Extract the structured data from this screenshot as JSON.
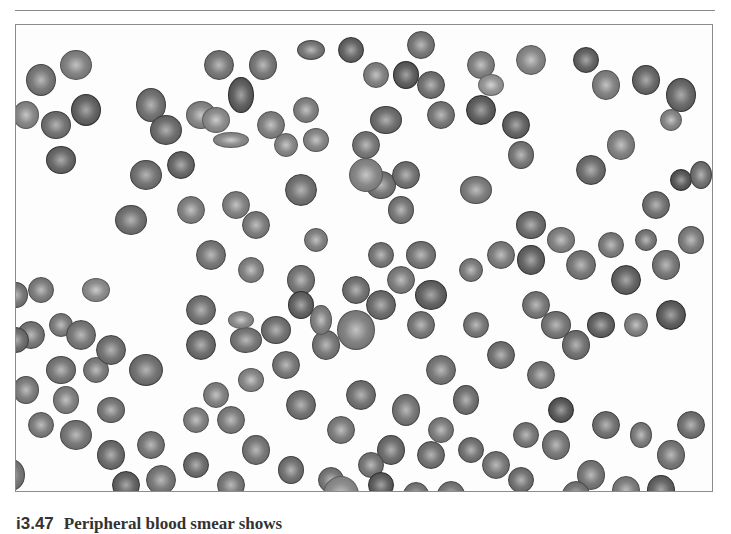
{
  "page": {
    "header_text": "",
    "caption_number": "i3.47",
    "caption_text": "Peripheral blood smear shows"
  },
  "figure": {
    "colors": {
      "background": "#fdfdfd",
      "frame": "#8c8c8c",
      "cell_dark": "#4a4a4a",
      "cell_mid": "#7a7a7a",
      "cell_light": "#bdbdbd"
    },
    "cells": [
      [
        40,
        55,
        30,
        32,
        0.55
      ],
      [
        75,
        40,
        32,
        30,
        0.45
      ],
      [
        85,
        85,
        30,
        32,
        0.75
      ],
      [
        25,
        90,
        26,
        28,
        0.4
      ],
      [
        55,
        100,
        30,
        28,
        0.6
      ],
      [
        60,
        135,
        30,
        28,
        0.7
      ],
      [
        150,
        80,
        30,
        34,
        0.6
      ],
      [
        200,
        90,
        30,
        28,
        0.4
      ],
      [
        215,
        95,
        28,
        26,
        0.35
      ],
      [
        230,
        115,
        36,
        16,
        0.35
      ],
      [
        165,
        105,
        32,
        30,
        0.65
      ],
      [
        180,
        140,
        28,
        28,
        0.7
      ],
      [
        145,
        150,
        32,
        30,
        0.6
      ],
      [
        218,
        40,
        30,
        30,
        0.55
      ],
      [
        262,
        40,
        28,
        30,
        0.55
      ],
      [
        240,
        70,
        26,
        36,
        0.8
      ],
      [
        270,
        100,
        28,
        28,
        0.45
      ],
      [
        285,
        120,
        24,
        24,
        0.4
      ],
      [
        305,
        85,
        26,
        26,
        0.45
      ],
      [
        315,
        115,
        26,
        24,
        0.4
      ],
      [
        310,
        25,
        28,
        20,
        0.55
      ],
      [
        130,
        195,
        32,
        30,
        0.6
      ],
      [
        190,
        185,
        28,
        28,
        0.45
      ],
      [
        235,
        180,
        28,
        28,
        0.45
      ],
      [
        255,
        200,
        28,
        28,
        0.5
      ],
      [
        300,
        165,
        32,
        32,
        0.6
      ],
      [
        210,
        230,
        30,
        30,
        0.55
      ],
      [
        315,
        215,
        24,
        24,
        0.45
      ],
      [
        250,
        245,
        26,
        26,
        0.45
      ],
      [
        300,
        255,
        28,
        30,
        0.55
      ],
      [
        350,
        25,
        26,
        26,
        0.75
      ],
      [
        375,
        50,
        26,
        26,
        0.45
      ],
      [
        405,
        50,
        26,
        28,
        0.8
      ],
      [
        420,
        20,
        28,
        28,
        0.55
      ],
      [
        365,
        120,
        28,
        28,
        0.55
      ],
      [
        430,
        60,
        28,
        28,
        0.6
      ],
      [
        440,
        90,
        28,
        28,
        0.55
      ],
      [
        480,
        40,
        28,
        28,
        0.45
      ],
      [
        530,
        35,
        30,
        30,
        0.4
      ],
      [
        585,
        35,
        26,
        26,
        0.75
      ],
      [
        605,
        60,
        28,
        30,
        0.45
      ],
      [
        645,
        55,
        28,
        30,
        0.7
      ],
      [
        680,
        70,
        30,
        34,
        0.7
      ],
      [
        670,
        95,
        22,
        22,
        0.4
      ],
      [
        490,
        60,
        26,
        22,
        0.25
      ],
      [
        385,
        95,
        32,
        28,
        0.65
      ],
      [
        380,
        160,
        30,
        28,
        0.55
      ],
      [
        365,
        150,
        34,
        34,
        0.4
      ],
      [
        405,
        150,
        28,
        28,
        0.6
      ],
      [
        400,
        185,
        26,
        28,
        0.55
      ],
      [
        480,
        85,
        30,
        30,
        0.8
      ],
      [
        515,
        100,
        28,
        28,
        0.75
      ],
      [
        520,
        130,
        26,
        28,
        0.55
      ],
      [
        475,
        165,
        32,
        28,
        0.5
      ],
      [
        530,
        200,
        30,
        28,
        0.65
      ],
      [
        590,
        145,
        30,
        30,
        0.65
      ],
      [
        620,
        120,
        28,
        30,
        0.45
      ],
      [
        655,
        180,
        28,
        28,
        0.6
      ],
      [
        680,
        155,
        22,
        22,
        0.85
      ],
      [
        700,
        150,
        22,
        28,
        0.6
      ],
      [
        420,
        230,
        30,
        28,
        0.55
      ],
      [
        400,
        255,
        28,
        28,
        0.5
      ],
      [
        430,
        270,
        32,
        30,
        0.75
      ],
      [
        380,
        230,
        26,
        26,
        0.55
      ],
      [
        470,
        245,
        24,
        24,
        0.5
      ],
      [
        500,
        230,
        28,
        28,
        0.5
      ],
      [
        530,
        235,
        28,
        30,
        0.75
      ],
      [
        560,
        215,
        28,
        26,
        0.45
      ],
      [
        580,
        240,
        30,
        30,
        0.55
      ],
      [
        610,
        220,
        26,
        26,
        0.5
      ],
      [
        625,
        255,
        30,
        30,
        0.75
      ],
      [
        645,
        215,
        22,
        22,
        0.55
      ],
      [
        665,
        240,
        28,
        30,
        0.55
      ],
      [
        690,
        215,
        26,
        28,
        0.5
      ],
      [
        15,
        270,
        24,
        26,
        0.55
      ],
      [
        40,
        265,
        26,
        26,
        0.5
      ],
      [
        30,
        310,
        28,
        28,
        0.55
      ],
      [
        60,
        300,
        24,
        24,
        0.5
      ],
      [
        80,
        310,
        30,
        30,
        0.55
      ],
      [
        95,
        265,
        28,
        24,
        0.35
      ],
      [
        15,
        315,
        26,
        26,
        0.65
      ],
      [
        60,
        345,
        30,
        28,
        0.55
      ],
      [
        95,
        345,
        26,
        26,
        0.5
      ],
      [
        110,
        325,
        30,
        30,
        0.6
      ],
      [
        145,
        345,
        34,
        32,
        0.6
      ],
      [
        25,
        365,
        26,
        28,
        0.5
      ],
      [
        65,
        375,
        26,
        28,
        0.45
      ],
      [
        110,
        385,
        28,
        26,
        0.55
      ],
      [
        40,
        400,
        26,
        26,
        0.5
      ],
      [
        75,
        410,
        32,
        30,
        0.55
      ],
      [
        110,
        430,
        28,
        30,
        0.65
      ],
      [
        150,
        420,
        28,
        28,
        0.55
      ],
      [
        125,
        460,
        28,
        28,
        0.75
      ],
      [
        160,
        455,
        30,
        30,
        0.55
      ],
      [
        10,
        450,
        28,
        32,
        0.55
      ],
      [
        40,
        495,
        26,
        26,
        0.5
      ],
      [
        200,
        285,
        30,
        30,
        0.6
      ],
      [
        200,
        320,
        30,
        30,
        0.65
      ],
      [
        245,
        315,
        32,
        26,
        0.55
      ],
      [
        240,
        295,
        26,
        18,
        0.35
      ],
      [
        275,
        305,
        30,
        28,
        0.6
      ],
      [
        300,
        280,
        26,
        28,
        0.75
      ],
      [
        325,
        320,
        28,
        30,
        0.55
      ],
      [
        320,
        295,
        22,
        30,
        0.45
      ],
      [
        250,
        355,
        26,
        24,
        0.4
      ],
      [
        285,
        340,
        28,
        28,
        0.55
      ],
      [
        215,
        370,
        26,
        26,
        0.45
      ],
      [
        230,
        395,
        28,
        28,
        0.5
      ],
      [
        195,
        395,
        26,
        26,
        0.45
      ],
      [
        300,
        380,
        30,
        30,
        0.6
      ],
      [
        255,
        425,
        28,
        30,
        0.55
      ],
      [
        195,
        440,
        26,
        26,
        0.65
      ],
      [
        230,
        460,
        28,
        28,
        0.55
      ],
      [
        290,
        445,
        26,
        28,
        0.6
      ],
      [
        330,
        455,
        26,
        26,
        0.55
      ],
      [
        355,
        305,
        38,
        40,
        0.45
      ],
      [
        380,
        280,
        30,
        30,
        0.65
      ],
      [
        355,
        265,
        28,
        28,
        0.6
      ],
      [
        420,
        300,
        28,
        28,
        0.55
      ],
      [
        440,
        345,
        30,
        30,
        0.55
      ],
      [
        360,
        370,
        30,
        30,
        0.6
      ],
      [
        405,
        385,
        28,
        32,
        0.55
      ],
      [
        340,
        405,
        28,
        28,
        0.5
      ],
      [
        390,
        425,
        28,
        30,
        0.65
      ],
      [
        370,
        440,
        26,
        26,
        0.55
      ],
      [
        340,
        470,
        36,
        38,
        0.35
      ],
      [
        380,
        460,
        26,
        26,
        0.8
      ],
      [
        430,
        430,
        28,
        28,
        0.6
      ],
      [
        440,
        405,
        26,
        26,
        0.5
      ],
      [
        465,
        375,
        26,
        30,
        0.6
      ],
      [
        475,
        300,
        26,
        26,
        0.55
      ],
      [
        500,
        330,
        28,
        28,
        0.6
      ],
      [
        535,
        280,
        28,
        28,
        0.55
      ],
      [
        555,
        300,
        30,
        28,
        0.55
      ],
      [
        575,
        320,
        28,
        30,
        0.6
      ],
      [
        600,
        300,
        28,
        26,
        0.75
      ],
      [
        635,
        300,
        24,
        24,
        0.45
      ],
      [
        670,
        290,
        30,
        30,
        0.8
      ],
      [
        540,
        350,
        28,
        28,
        0.55
      ],
      [
        560,
        385,
        26,
        26,
        0.85
      ],
      [
        525,
        410,
        26,
        26,
        0.55
      ],
      [
        495,
        440,
        28,
        28,
        0.55
      ],
      [
        520,
        455,
        26,
        26,
        0.6
      ],
      [
        555,
        420,
        28,
        30,
        0.55
      ],
      [
        590,
        450,
        28,
        30,
        0.55
      ],
      [
        625,
        465,
        28,
        28,
        0.5
      ],
      [
        605,
        400,
        28,
        28,
        0.6
      ],
      [
        640,
        410,
        22,
        26,
        0.5
      ],
      [
        670,
        430,
        28,
        30,
        0.55
      ],
      [
        690,
        400,
        28,
        28,
        0.6
      ],
      [
        575,
        470,
        28,
        28,
        0.55
      ],
      [
        660,
        465,
        28,
        30,
        0.75
      ],
      [
        450,
        470,
        28,
        28,
        0.55
      ],
      [
        470,
        425,
        26,
        26,
        0.6
      ],
      [
        415,
        470,
        26,
        26,
        0.55
      ]
    ]
  }
}
